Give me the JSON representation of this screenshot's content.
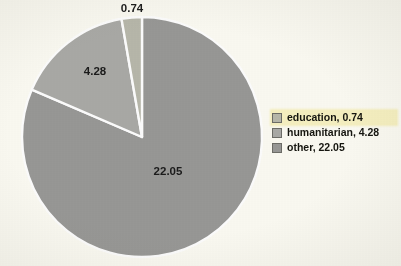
{
  "chart_data": {
    "type": "pie",
    "title": "",
    "categories": [
      "education",
      "humanitarian",
      "other"
    ],
    "values": [
      0.74,
      4.28,
      22.05
    ],
    "total": 27.07,
    "data_labels": [
      "0.74",
      "4.28",
      "22.05"
    ],
    "colors": [
      "#b9b9ac",
      "#ababa7",
      "#999997"
    ],
    "slice_separator_color": "#ffffff",
    "start_angle_deg": 90,
    "direction": "counterclockwise",
    "legend": {
      "position": "right",
      "entries": [
        {
          "label": "education, 0.74",
          "category": "education",
          "value": 0.74,
          "color": "#b9b9ac",
          "highlighted": true
        },
        {
          "label": "humanitarian, 4.28",
          "category": "humanitarian",
          "value": 4.28,
          "color": "#ababa7",
          "highlighted": false
        },
        {
          "label": "other, 22.05",
          "category": "other",
          "value": 22.05,
          "color": "#999997",
          "highlighted": false
        }
      ],
      "highlight_color": "#f8f2c2"
    },
    "grid": false,
    "xlabel": "",
    "ylabel": ""
  },
  "figure": {
    "background_color": "#fdfcf4",
    "pie_center_x": 142,
    "pie_center_y": 137,
    "pie_radius": 120
  },
  "slice_labels": {
    "education": "0.74",
    "humanitarian": "4.28",
    "other": "22.05"
  },
  "label_positions": {
    "education": {
      "x": 132,
      "y": 9
    },
    "humanitarian": {
      "x": 95,
      "y": 72
    },
    "other": {
      "x": 168,
      "y": 172
    }
  }
}
